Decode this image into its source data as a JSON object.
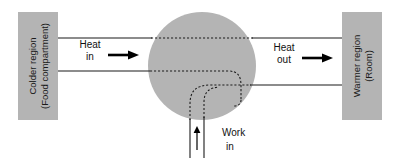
{
  "diagram": {
    "type": "thermodynamic-energy-flow",
    "colors": {
      "block_fill": "#b4b4b4",
      "device_fill": "#b4b4b4",
      "line": "#1a1a1a",
      "background": "#ffffff"
    },
    "left_block": {
      "label_line_1": "Colder region",
      "label_line_2": "(Food compartment)"
    },
    "right_block": {
      "label_line_1": "Warmer region",
      "label_line_2": "(Room)"
    },
    "heat_in": {
      "label_line_1": "Heat",
      "label_line_2": "in",
      "direction": "right"
    },
    "heat_out": {
      "label_line_1": "Heat",
      "label_line_2": "out",
      "direction": "right"
    },
    "work_in": {
      "label_line_1": "Work",
      "label_line_2": "in",
      "direction": "up"
    }
  }
}
